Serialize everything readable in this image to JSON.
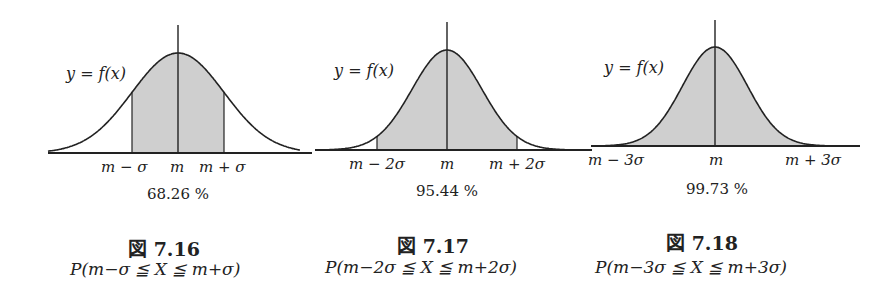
{
  "figures": [
    {
      "id": "fig-7-16",
      "curve_label": "y = f(x)",
      "tick_labels": [
        "m − σ",
        "m",
        "m + σ"
      ],
      "percentage": "68.26 %",
      "caption_prefix": "図",
      "caption_number": "7.16",
      "caption_formula": "P(m−σ ≦ X ≦ m+σ)"
    },
    {
      "id": "fig-7-17",
      "curve_label": "y = f(x)",
      "tick_labels": [
        "m − 2σ",
        "m",
        "m + 2σ"
      ],
      "percentage": "95.44 %",
      "caption_prefix": "図",
      "caption_number": "7.17",
      "caption_formula": "P(m−2σ ≦ X ≦ m+2σ)"
    },
    {
      "id": "fig-7-18",
      "curve_label": "y = f(x)",
      "tick_labels": [
        "m − 3σ",
        "m",
        "m + 3σ"
      ],
      "percentage": "99.73 %",
      "caption_prefix": "図",
      "caption_number": "7.18",
      "caption_formula": "P(m−3σ ≦ X ≦ m+3σ)"
    }
  ],
  "colors": {
    "line": "#222222",
    "shade": "#cfcfcf",
    "background": "#ffffff"
  },
  "chart_data": [
    {
      "type": "area",
      "title": "図 7.16",
      "subtitle": "P(m−σ ≦ X ≦ m+σ)",
      "curve": "normal density y = f(x)",
      "shaded_interval": [
        "m−σ",
        "m+σ"
      ],
      "x_tick_labels": [
        "m−σ",
        "m",
        "m+σ"
      ],
      "shaded_probability_percent": 68.26,
      "annotation": "68.26 %"
    },
    {
      "type": "area",
      "title": "図 7.17",
      "subtitle": "P(m−2σ ≦ X ≦ m+2σ)",
      "curve": "normal density y = f(x)",
      "shaded_interval": [
        "m−2σ",
        "m+2σ"
      ],
      "x_tick_labels": [
        "m−2σ",
        "m",
        "m+2σ"
      ],
      "shaded_probability_percent": 95.44,
      "annotation": "95.44 %"
    },
    {
      "type": "area",
      "title": "図 7.18",
      "subtitle": "P(m−3σ ≦ X ≦ m+3σ)",
      "curve": "normal density y = f(x)",
      "shaded_interval": [
        "m−3σ",
        "m+3σ"
      ],
      "x_tick_labels": [
        "m−3σ",
        "m",
        "m+3σ"
      ],
      "shaded_probability_percent": 99.73,
      "annotation": "99.73 %"
    }
  ]
}
